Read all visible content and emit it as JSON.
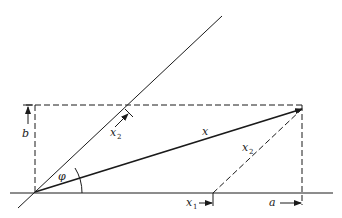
{
  "diagram": {
    "type": "vector decomposition in oblique coordinates",
    "colors": {
      "ink": "#1a1a1a",
      "background": "#ffffff"
    },
    "axes": {
      "horizontal_axis": {
        "from": [
          10,
          193
        ],
        "to": [
          333,
          193
        ]
      },
      "oblique_axis": {
        "from": [
          18,
          208
        ],
        "to": [
          222,
          16
        ]
      },
      "origin": [
        35,
        192
      ]
    },
    "vector_x": {
      "from": [
        35,
        192
      ],
      "to": [
        302,
        109
      ],
      "label": "x"
    },
    "angle": {
      "label": "φ"
    },
    "components": {
      "x1": {
        "label": "x",
        "subscript": "1"
      },
      "x2_parallel": {
        "label": "x",
        "subscript": "2"
      },
      "x2_oblique": {
        "label": "x",
        "subscript": "2"
      }
    },
    "dimensions": {
      "a": {
        "label": "a"
      },
      "b": {
        "label": "b"
      }
    }
  }
}
